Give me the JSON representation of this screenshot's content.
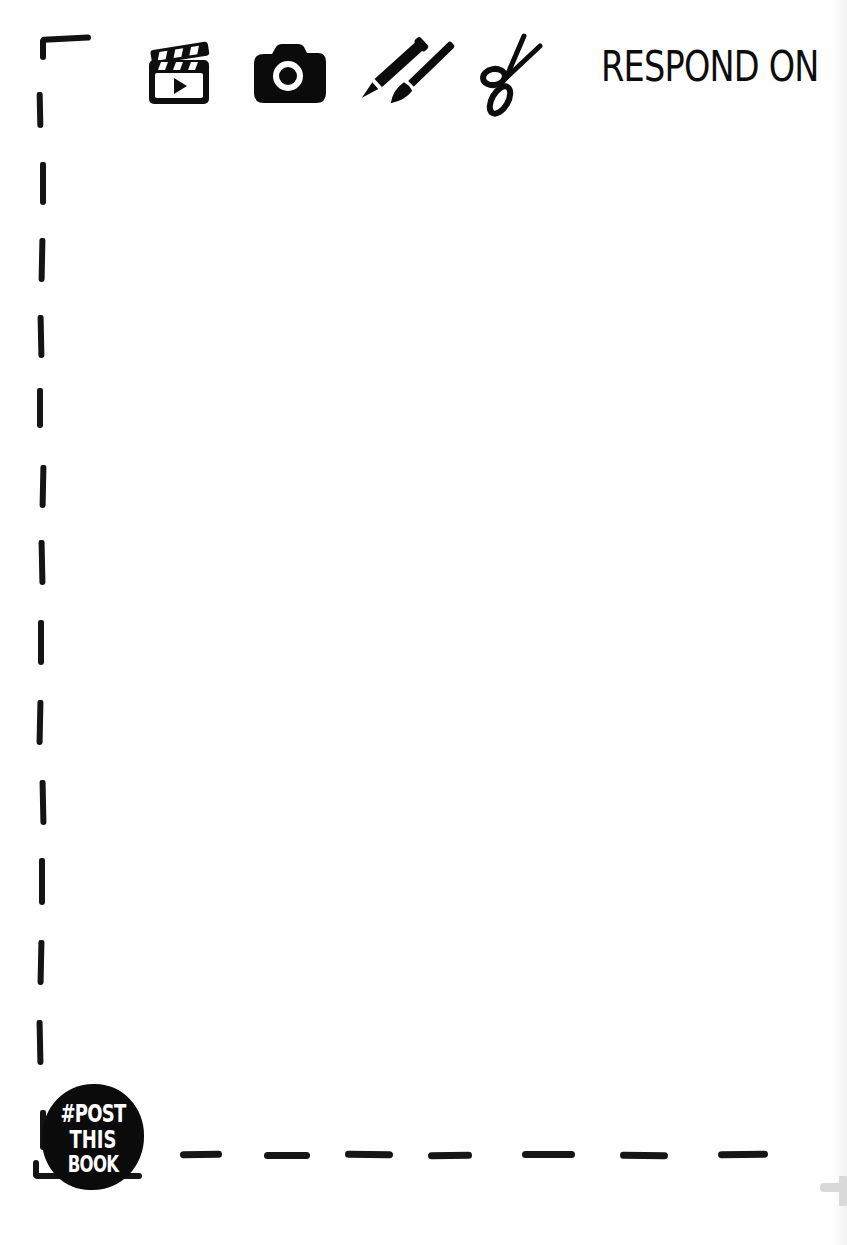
{
  "page": {
    "background": "#fefefe",
    "ink_color": "#111111"
  },
  "header": {
    "prompt_text": "RESPOND ON",
    "media_icons": [
      {
        "name": "video-clapperboard-icon",
        "meaning": "video"
      },
      {
        "name": "camera-icon",
        "meaning": "photo"
      },
      {
        "name": "pen-and-brush-icon",
        "meaning": "draw / paint"
      },
      {
        "name": "scissors-icon",
        "meaning": "cut / collage"
      }
    ]
  },
  "badge": {
    "lines": [
      "#POST",
      "THIS",
      "BOOK"
    ]
  },
  "frame": {
    "style": "hand-drawn dashed border (top-left corner, left edge, bottom edge)",
    "left_dashes_y": [
      [
        92,
        128
      ],
      [
        162,
        205
      ],
      [
        238,
        282
      ],
      [
        315,
        358
      ],
      [
        388,
        428
      ],
      [
        465,
        508
      ],
      [
        540,
        585
      ],
      [
        620,
        665
      ],
      [
        700,
        745
      ],
      [
        780,
        825
      ],
      [
        858,
        905
      ],
      [
        940,
        985
      ],
      [
        1020,
        1065
      ],
      [
        1110,
        1150
      ]
    ],
    "bottom_dashes_x": [
      [
        180,
        222
      ],
      [
        264,
        310
      ],
      [
        345,
        393
      ],
      [
        428,
        472
      ],
      [
        522,
        575
      ],
      [
        620,
        668
      ],
      [
        718,
        768
      ]
    ]
  }
}
